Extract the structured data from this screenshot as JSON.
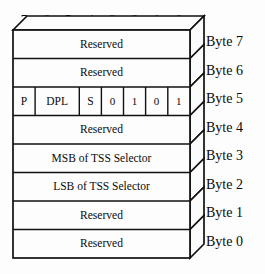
{
  "diagram": {
    "bit_ruler": {
      "labels": [
        "7",
        "6",
        "5",
        "4",
        "3",
        "2",
        "1",
        "0"
      ]
    },
    "byte_labels": [
      "Byte 7",
      "Byte 6",
      "Byte 5",
      "Byte 4",
      "Byte 3",
      "Byte 2",
      "Byte 1",
      "Byte 0"
    ],
    "rows": [
      {
        "byte": "Byte 7",
        "type": "single",
        "label": "Reserved"
      },
      {
        "byte": "Byte 6",
        "type": "single",
        "label": "Reserved"
      },
      {
        "byte": "Byte 5",
        "type": "split",
        "cells": [
          {
            "label": "P",
            "bits": "7",
            "span": 1
          },
          {
            "label": "DPL",
            "bits": "6-5",
            "span": 2
          },
          {
            "label": "S",
            "bits": "4",
            "span": 1
          },
          {
            "label": "0",
            "bits": "3",
            "span": 1
          },
          {
            "label": "1",
            "bits": "2",
            "span": 1
          },
          {
            "label": "0",
            "bits": "1",
            "span": 1
          },
          {
            "label": "1",
            "bits": "0",
            "span": 1
          }
        ]
      },
      {
        "byte": "Byte 4",
        "type": "single",
        "label": "Reserved"
      },
      {
        "byte": "Byte 3",
        "type": "single",
        "label": "MSB of TSS Selector"
      },
      {
        "byte": "Byte 2",
        "type": "single",
        "label": "LSB of TSS Selector"
      },
      {
        "byte": "Byte 1",
        "type": "single",
        "label": "Reserved"
      },
      {
        "byte": "Byte 0",
        "type": "single",
        "label": "Reserved"
      }
    ],
    "colors": {
      "background": "#fdfdfd",
      "stroke": "#111111",
      "text": "#0a0a0a",
      "face_fill": "#fdfdfd",
      "side_fill": "#fbfbfb"
    }
  }
}
